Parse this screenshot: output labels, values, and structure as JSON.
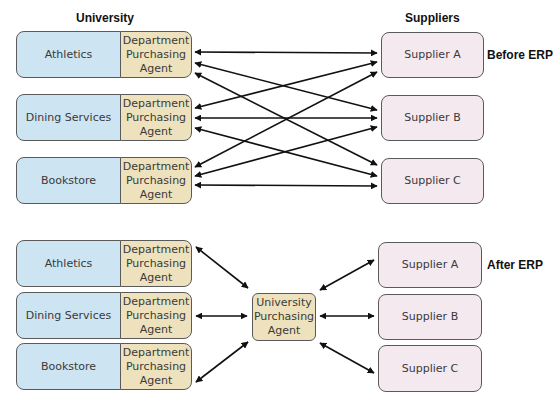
{
  "headings": {
    "university": "University",
    "suppliers": "Suppliers"
  },
  "before": {
    "label": "Before ERP",
    "departments": [
      {
        "name": "Athletics",
        "agent": "Department Purchasing Agent"
      },
      {
        "name": "Dining Services",
        "agent": "Department Purchasing Agent"
      },
      {
        "name": "Bookstore",
        "agent": "Department Purchasing Agent"
      }
    ],
    "suppliers": [
      "Supplier A",
      "Supplier B",
      "Supplier C"
    ]
  },
  "after": {
    "label": "After ERP",
    "departments": [
      {
        "name": "Athletics",
        "agent": "Department Purchasing Agent"
      },
      {
        "name": "Dining Services",
        "agent": "Department Purchasing Agent"
      },
      {
        "name": "Bookstore",
        "agent": "Department Purchasing Agent"
      }
    ],
    "central_agent": "University Purchasing Agent",
    "suppliers": [
      "Supplier A",
      "Supplier B",
      "Supplier C"
    ]
  },
  "colors": {
    "department": "#cde4f2",
    "agent": "#ede2bd",
    "supplier": "#f4e9ef",
    "border": "#5a5a5a",
    "arrow": "#111111"
  }
}
